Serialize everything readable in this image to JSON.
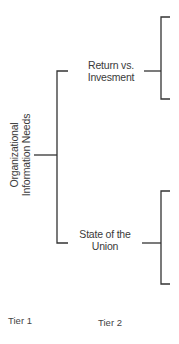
{
  "diagram": {
    "root": {
      "line1": "Organizational",
      "line2": "Information Needs"
    },
    "tier2": [
      {
        "line1": "Return vs.",
        "line2": "Invesment"
      },
      {
        "line1": "State of the",
        "line2": "Union"
      }
    ],
    "tiers": [
      "Tier 1",
      "Tier 2"
    ],
    "line_color": "#333333"
  }
}
